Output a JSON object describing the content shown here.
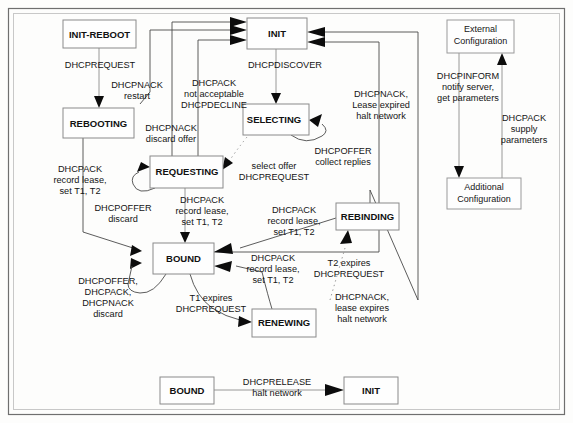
{
  "figure": {
    "background_color": "#fdfdfc",
    "frame_color": "#6f6f6f"
  },
  "states": [
    {
      "id": "init-reboot",
      "label": "INIT-REBOOT",
      "x": 63,
      "y": 20,
      "w": 73,
      "h": 28
    },
    {
      "id": "init",
      "label": "INIT",
      "x": 247,
      "y": 18,
      "w": 60,
      "h": 31
    },
    {
      "id": "rebooting",
      "label": "REBOOTING",
      "x": 63,
      "y": 108,
      "w": 71,
      "h": 30
    },
    {
      "id": "selecting",
      "label": "SELECTING",
      "x": 243,
      "y": 104,
      "w": 66,
      "h": 31
    },
    {
      "id": "requesting",
      "label": "REQUESTING",
      "x": 150,
      "y": 156,
      "w": 73,
      "h": 32
    },
    {
      "id": "rebinding",
      "label": "REBINDING",
      "x": 336,
      "y": 203,
      "w": 63,
      "h": 27
    },
    {
      "id": "bound",
      "label": "BOUND",
      "x": 153,
      "y": 243,
      "w": 61,
      "h": 31
    },
    {
      "id": "renewing",
      "label": "RENEWING",
      "x": 252,
      "y": 309,
      "w": 64,
      "h": 28
    },
    {
      "id": "bound-bottom",
      "label": "BOUND",
      "x": 160,
      "y": 377,
      "w": 54,
      "h": 27
    },
    {
      "id": "init-bottom",
      "label": "INIT",
      "x": 344,
      "y": 377,
      "w": 54,
      "h": 27
    }
  ],
  "external_boxes": [
    {
      "id": "external-configuration",
      "lines": [
        "External",
        "Configuration"
      ],
      "x": 447,
      "y": 20,
      "w": 67,
      "h": 33
    },
    {
      "id": "additional-configuration",
      "lines": [
        "Additional",
        "Configuration"
      ],
      "x": 447,
      "y": 178,
      "w": 74,
      "h": 31
    }
  ],
  "transitions": [
    {
      "id": "init-reboot-to-rebooting",
      "from": "INIT-REBOOT",
      "to": "REBOOTING",
      "lines": [
        "DHCPREQUEST"
      ],
      "label_x": 100,
      "label_y": 68
    },
    {
      "id": "rebooting-to-init",
      "from": "REBOOTING",
      "to": "INIT",
      "lines": [
        "DHCPNACK",
        "restart"
      ],
      "label_x": 137,
      "label_y": 88
    },
    {
      "id": "requesting-to-init-decline",
      "from": "REQUESTING",
      "to": "INIT",
      "lines": [
        "DHCPACK",
        "not acceptable",
        "DHCPDECLINE"
      ],
      "label_x": 214,
      "label_y": 88
    },
    {
      "id": "init-to-selecting",
      "from": "INIT",
      "to": "SELECTING",
      "lines": [
        "DHCPDISCOVER"
      ],
      "label_x": 283,
      "label_y": 68
    },
    {
      "id": "requesting-to-init-nack",
      "from": "REQUESTING",
      "to": "INIT",
      "lines": [
        "DHCPNACK",
        "discard offer"
      ],
      "label_x": 171,
      "label_y": 133
    },
    {
      "id": "selecting-self-offer",
      "from": "SELECTING",
      "to": "SELECTING",
      "lines": [
        "DHCPOFFER",
        "collect replies"
      ],
      "label_x": 343,
      "label_y": 155
    },
    {
      "id": "bound-to-init-nack-expired",
      "from": "BOUND",
      "to": "INIT",
      "lines": [
        "DHCPNACK,",
        "Lease expired",
        "halt network"
      ],
      "label_x": 381,
      "label_y": 98
    },
    {
      "id": "selecting-to-requesting",
      "from": "SELECTING",
      "to": "REQUESTING",
      "lines": [
        "select offer",
        "DHCPREQUEST"
      ],
      "label_x": 273,
      "label_y": 170
    },
    {
      "id": "rebooting-to-bound",
      "from": "REBOOTING",
      "to": "BOUND",
      "lines": [
        "DHCPACK",
        "record lease,",
        "set T1, T2"
      ],
      "label_x": 80,
      "label_y": 175
    },
    {
      "id": "requesting-self-offer",
      "from": "REQUESTING",
      "to": "REQUESTING",
      "lines": [
        "DHCPOFFER",
        "discard"
      ],
      "label_x": 121,
      "label_y": 212
    },
    {
      "id": "requesting-to-bound",
      "from": "REQUESTING",
      "to": "BOUND",
      "lines": [
        "DHCPACK",
        "record lease,",
        "set T1, T2"
      ],
      "label_x": 201,
      "label_y": 205
    },
    {
      "id": "rebinding-to-bound",
      "from": "REBINDING",
      "to": "BOUND",
      "lines": [
        "DHCPACK",
        "record lease,",
        "set T1, T2"
      ],
      "label_x": 293,
      "label_y": 215
    },
    {
      "id": "renewing-to-bound",
      "from": "RENEWING",
      "to": "BOUND",
      "lines": [
        "DHCPACK",
        "record lease,",
        "set T1, T2"
      ],
      "label_x": 272,
      "label_y": 268
    },
    {
      "id": "bound-self-discard",
      "from": "BOUND",
      "to": "BOUND",
      "lines": [
        "DHCPOFFER,",
        "DHCPACK,",
        "DHCPNACK",
        "discard"
      ],
      "label_x": 106,
      "label_y": 285
    },
    {
      "id": "bound-to-renewing",
      "from": "BOUND",
      "to": "RENEWING",
      "lines": [
        "T1 expires",
        "DHCPREQUEST"
      ],
      "label_x": 208,
      "label_y": 303
    },
    {
      "id": "renewing-to-rebinding",
      "from": "RENEWING",
      "to": "REBINDING",
      "lines": [
        "T2 expires",
        "DHCPREQUEST"
      ],
      "label_x": 348,
      "label_y": 280
    },
    {
      "id": "rebinding-to-init",
      "from": "REBINDING",
      "to": "INIT",
      "lines": [
        "DHCPNACK,",
        "lease expires",
        "halt network"
      ],
      "label_x": 361,
      "label_y": 308
    },
    {
      "id": "bound-bottom-to-init-bottom",
      "from": "BOUND",
      "to": "INIT",
      "lines": [
        "DHCPRELEASE",
        "halt network"
      ],
      "label_x": 277,
      "label_y": 385
    },
    {
      "id": "external-to-additional-inform",
      "from": "External Configuration",
      "to": "Additional Configuration",
      "lines": [
        "DHCPINFORM",
        "notify server,",
        "get parameters"
      ],
      "label_x": 467,
      "label_y": 87
    },
    {
      "id": "additional-to-external-ack",
      "from": "Additional Configuration",
      "to": "External Configuration",
      "lines": [
        "DHCPACK",
        "supply",
        "parameters"
      ],
      "label_x": 523,
      "label_y": 128
    }
  ]
}
